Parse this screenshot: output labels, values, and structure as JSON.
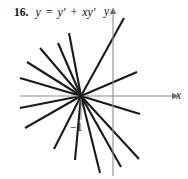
{
  "figure": {
    "problem_number": "16.",
    "equation_parts": {
      "lhs": "y",
      "equals": "=",
      "term1": "y′",
      "plus": "+",
      "term2": "xy′"
    },
    "equation_text": "y = y′ + xy′",
    "line_color": "#1a1a1a",
    "axis_color": "#8c8c8c",
    "background_color": "#ffffff"
  },
  "axes": {
    "x_label": "x",
    "y_label": "y",
    "x_axis": {
      "x1": 20,
      "y1": 96,
      "x2": 172,
      "y2": 96
    },
    "y_axis": {
      "x1": 113,
      "y1": 14,
      "x2": 113,
      "y2": 176
    },
    "x_arrow": "right-arrow-head",
    "y_arrow": "up-arrow-head"
  },
  "tick": {
    "label": "−1",
    "axis": "y",
    "value": -1,
    "marker_line": {
      "x1": 81,
      "y1": 99,
      "x2": 81,
      "y2": 120
    }
  },
  "chart_data": {
    "type": "line",
    "title": "",
    "xlabel": "x",
    "ylabel": "y",
    "focus_point": {
      "px": 81,
      "py": 96
    },
    "grid": false,
    "legend": false,
    "series": [
      {
        "name": "line-1",
        "x": [
          20,
          81
        ],
        "y": [
          78,
          96
        ]
      },
      {
        "name": "line-2",
        "x": [
          27,
          81
        ],
        "y": [
          62,
          96
        ]
      },
      {
        "name": "line-3",
        "x": [
          40,
          81
        ],
        "y": [
          48,
          96
        ]
      },
      {
        "name": "line-4",
        "x": [
          58,
          81
        ],
        "y": [
          43,
          96
        ]
      },
      {
        "name": "line-5",
        "x": [
          69,
          81
        ],
        "y": [
          33,
          96
        ]
      },
      {
        "name": "line-6",
        "x": [
          124,
          81
        ],
        "y": [
          18,
          96
        ]
      },
      {
        "name": "line-7",
        "x": [
          137,
          81
        ],
        "y": [
          72,
          96
        ]
      },
      {
        "name": "line-8",
        "x": [
          140,
          81
        ],
        "y": [
          114,
          96
        ]
      },
      {
        "name": "line-9",
        "x": [
          139,
          81
        ],
        "y": [
          159,
          96
        ]
      },
      {
        "name": "line-10",
        "x": [
          121,
          81
        ],
        "y": [
          167,
          96
        ]
      },
      {
        "name": "line-11",
        "x": [
          100,
          81
        ],
        "y": [
          173,
          96
        ]
      },
      {
        "name": "line-12",
        "x": [
          75,
          81
        ],
        "y": [
          160,
          96
        ]
      },
      {
        "name": "line-13",
        "x": [
          54,
          81
        ],
        "y": [
          149,
          96
        ]
      },
      {
        "name": "line-14",
        "x": [
          25,
          81
        ],
        "y": [
          128,
          96
        ]
      },
      {
        "name": "line-15",
        "x": [
          20,
          81
        ],
        "y": [
          108,
          96
        ]
      }
    ]
  }
}
